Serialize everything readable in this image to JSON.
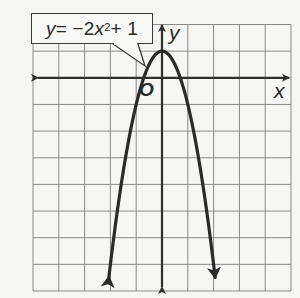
{
  "chart_data": {
    "type": "line",
    "title": "",
    "equation_label": "y = −2x² + 1",
    "function": "y = -2x^2 + 1",
    "xlabel": "x",
    "ylabel": "y",
    "origin_label": "O",
    "xlim": [
      -5,
      5
    ],
    "ylim": [
      -8,
      2
    ],
    "grid": true,
    "grid_step": 1,
    "vertex": [
      0,
      1
    ],
    "x_intercepts": [
      -0.707,
      0.707
    ],
    "series": [
      {
        "name": "y = -2x^2 + 1",
        "x": [
          -2.06,
          -2.0,
          -1.5,
          -1.0,
          -0.707,
          -0.5,
          0,
          0.5,
          0.707,
          1.0,
          1.5,
          2.0,
          2.06
        ],
        "y": [
          -7.5,
          -7,
          -3.5,
          -1,
          0,
          0.5,
          1,
          0.5,
          0,
          -1,
          -3.5,
          -7,
          -7.5
        ],
        "arrows_at_ends": true
      }
    ]
  },
  "labels": {
    "equation_y": "y",
    "equation_eq": " = −2",
    "equation_x": "x",
    "equation_exp": "2",
    "equation_tail": " + 1",
    "x_axis": "x",
    "y_axis": "y",
    "origin": "O"
  },
  "colors": {
    "background": "#f6f6f4",
    "grid": "#8a8a8a",
    "axes": "#2f2f2f",
    "curve": "#2a2a2a"
  }
}
